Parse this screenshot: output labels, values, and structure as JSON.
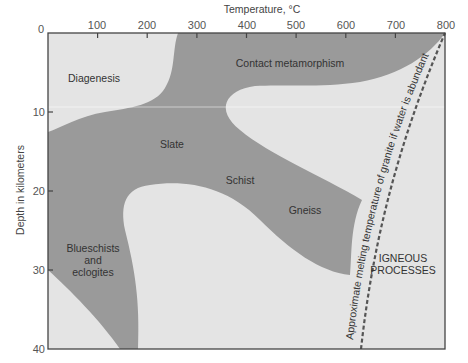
{
  "diagram": {
    "x_axis": {
      "title": "Temperature, °C",
      "ticks": [
        "0",
        "100",
        "200",
        "300",
        "400",
        "500",
        "600",
        "700",
        "800"
      ]
    },
    "y_axis": {
      "title": "Depth in kilometers",
      "ticks": [
        "10",
        "20",
        "30",
        "40"
      ]
    },
    "regions": {
      "diagenesis": "Diagenesis",
      "contact_metamorphism": "Contact metamorphism",
      "slate": "Slate",
      "schist": "Schist",
      "gneiss": "Gneiss",
      "blueschists_line1": "Blueschists",
      "blueschists_line2": "and",
      "blueschists_line3": "eclogites",
      "igneous_line1": "IGNEOUS",
      "igneous_line2": "PROCESSES"
    },
    "curve_label": "Approximate melting temperature of granite if water is abundant",
    "colors": {
      "metamorphic_fill": "#9a9a9a",
      "background_fill": "#e4e4e4",
      "axis": "#444444",
      "dashed_line": "#555555"
    }
  }
}
